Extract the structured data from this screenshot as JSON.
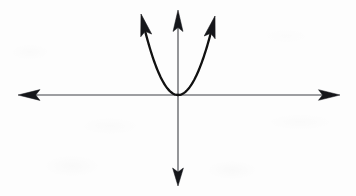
{
  "figure": {
    "title": "Upward-opening parabola with vertex at the origin on a coordinate plane",
    "background_color": "#fdfdfd",
    "width": 356,
    "height": 196
  },
  "chart_data": {
    "type": "line",
    "title": "",
    "subtitle": "",
    "xlabel": "",
    "ylabel": "",
    "grid": false,
    "legend": null,
    "axes": {
      "origin_px": [
        178,
        95
      ],
      "x_axis": {
        "name": "x-axis",
        "orientation": "horizontal",
        "y_px": 95,
        "start_px": 18,
        "end_px": 340,
        "arrowheads": "both",
        "color": "#3f4046",
        "stroke_width": 1.1,
        "tick_labels": [],
        "label": ""
      },
      "y_axis": {
        "name": "y-axis",
        "orientation": "vertical",
        "x_px": 178,
        "start_px": 10,
        "end_px": 186,
        "arrowheads": "both",
        "color": "#3f4046",
        "stroke_width": 1.1,
        "tick_labels": [],
        "label": ""
      }
    },
    "curves": [
      {
        "name": "parabola",
        "equation_form": "y = a*x^2, a > 0",
        "opens": "upward",
        "vertex_px": [
          178,
          95
        ],
        "vertex_math": [
          0,
          0
        ],
        "color": "#111111",
        "stroke_width": 2.3,
        "arrowheads": "both-ends-upward",
        "left_branch_tip_px": [
          141,
          14
        ],
        "right_branch_tip_px": [
          215,
          16
        ],
        "points_px": [
          [
            141,
            14
          ],
          [
            143,
            34
          ],
          [
            146,
            48
          ],
          [
            151,
            60
          ],
          [
            158,
            71
          ],
          [
            166,
            83
          ],
          [
            172,
            90
          ],
          [
            178,
            95
          ],
          [
            184,
            90
          ],
          [
            191,
            82
          ],
          [
            199,
            70
          ],
          [
            205,
            58
          ],
          [
            210,
            44
          ],
          [
            213,
            30
          ],
          [
            215,
            16
          ]
        ]
      }
    ],
    "annotations": []
  }
}
